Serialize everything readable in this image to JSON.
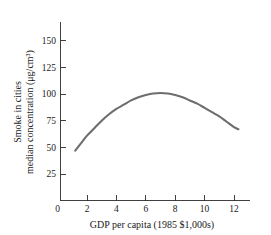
{
  "chart_data": {
    "type": "line",
    "title": "",
    "subtitle": "",
    "xlabel": "GDP per capita (1985 $1,000s)",
    "ylabel_line1": "Smoke in cities",
    "ylabel_line2": "median concentration (μg/cm³)",
    "ylabel_units": "μg/cm³",
    "xlim": [
      0,
      13.2
    ],
    "ylim": [
      0,
      162
    ],
    "xticks": [
      0,
      2,
      4,
      6,
      8,
      10,
      12
    ],
    "xtick_labels": [
      "0",
      "2",
      "4",
      "6",
      "8",
      "10",
      "12"
    ],
    "yticks": [
      25,
      50,
      75,
      100,
      125,
      150
    ],
    "ytick_labels": [
      "25",
      "50",
      "75",
      "100",
      "125",
      "150"
    ],
    "grid": false,
    "legend": "none",
    "curve_color": "#6d6d6d",
    "axis_color": "#2b2b2b",
    "series": [
      {
        "name": "Smoke in cities median concentration",
        "x": [
          1.2,
          1.6,
          2.0,
          2.5,
          3.0,
          3.5,
          4.0,
          4.5,
          5.0,
          5.5,
          6.0,
          6.5,
          7.0,
          7.5,
          8.0,
          8.5,
          9.0,
          9.5,
          10.0,
          10.5,
          11.0,
          11.5,
          12.0,
          12.3
        ],
        "y": [
          47,
          54,
          61,
          68,
          75,
          81,
          86,
          90,
          94,
          97,
          99,
          100.5,
          101,
          100.5,
          99,
          97,
          94,
          91,
          87,
          83,
          79,
          74,
          69,
          67
        ]
      }
    ],
    "annotations": {
      "peak_x": 7.0,
      "peak_y": 101,
      "left_endpoint": [
        1.2,
        47
      ],
      "right_endpoint": [
        12.3,
        67
      ],
      "shape": "inverted-U"
    }
  }
}
